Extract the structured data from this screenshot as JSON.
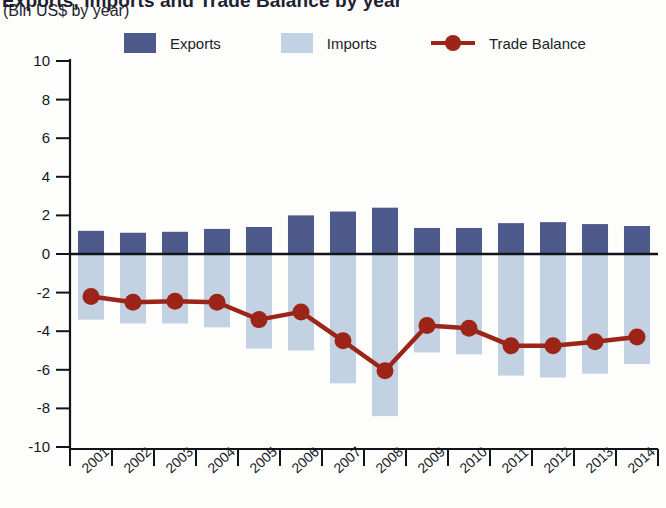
{
  "header": {
    "title": "Exports, Imports and Trade Balance by year",
    "subtitle": "(Bln US$ by year)"
  },
  "legend": {
    "items": [
      {
        "label": "Exports",
        "color": "#4e5a8c",
        "marker": "square-swatch"
      },
      {
        "label": "Imports",
        "color": "#c3d2e2",
        "marker": "square-swatch"
      },
      {
        "label": "Trade Balance",
        "color": "#9c2418",
        "marker": "line-dot"
      }
    ]
  },
  "chart_data": {
    "type": "bar",
    "title": "Exports, Imports and Trade Balance by year",
    "subtitle": "(Bln US$ by year)",
    "xlabel": "",
    "ylabel": "",
    "ylim": [
      -10,
      10
    ],
    "yticks": [
      10,
      8,
      6,
      4,
      2,
      0,
      -2,
      -4,
      -6,
      -8,
      -10
    ],
    "ytick_labels": [
      "10",
      "8",
      "6",
      "4",
      "2",
      "0",
      "-2",
      "-4",
      "-6",
      "-8",
      "-10"
    ],
    "grid": false,
    "legend_position": "top",
    "categories": [
      "2001",
      "2002",
      "2003",
      "2004",
      "2005",
      "2006",
      "2007",
      "2008",
      "2009",
      "2010",
      "2011",
      "2012",
      "2013",
      "2014"
    ],
    "series": [
      {
        "name": "Exports",
        "type": "bar",
        "color": "#4e5a8c",
        "values": [
          1.2,
          1.1,
          1.15,
          1.3,
          1.4,
          2.0,
          2.2,
          2.4,
          1.35,
          1.35,
          1.6,
          1.65,
          1.55,
          1.45
        ]
      },
      {
        "name": "Imports",
        "type": "bar",
        "color": "#c3d2e2",
        "values": [
          -3.4,
          -3.6,
          -3.6,
          -3.8,
          -4.9,
          -5.0,
          -6.7,
          -8.4,
          -5.1,
          -5.2,
          -6.3,
          -6.4,
          -6.2,
          -5.7
        ]
      },
      {
        "name": "Trade Balance",
        "type": "line",
        "color": "#9c2418",
        "values": [
          -2.2,
          -2.5,
          -2.45,
          -2.5,
          -3.4,
          -3.0,
          -4.5,
          -6.05,
          -3.7,
          -3.85,
          -4.75,
          -4.75,
          -4.55,
          -4.3
        ]
      }
    ]
  }
}
